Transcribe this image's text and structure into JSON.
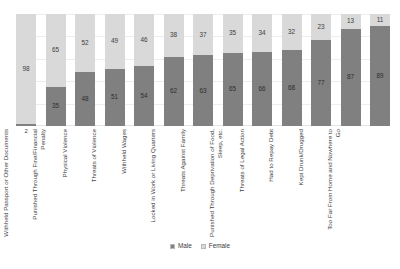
{
  "chart_data": {
    "type": "bar",
    "subtype": "stacked-100-percent",
    "orientation": "vertical",
    "title": "",
    "subtitle": "",
    "xlabel": "",
    "ylabel": "",
    "ylim": [
      0,
      100
    ],
    "grid": true,
    "grid_axis": "y",
    "y_ticks_visible": false,
    "legend_position": "bottom-center",
    "categories": [
      "Sexual Violence",
      "Withheld Passport or Other Documents",
      "Punished Through Fine/Financial Penalty",
      "Physical Violence",
      "Threats of Violence",
      "Withheld Wages",
      "Locked in Work or Living Quarters",
      "Threats Against Family",
      "Punished Through Deprivation of Food, Sleep, etc.",
      "Threats of Legal Action",
      "Had to Repay Debt",
      "Kept Drunk/Drugged",
      "Too Far From Home and Nowhere to Go"
    ],
    "series": [
      {
        "name": "Male",
        "color": "#808080",
        "values": [
          2,
          35,
          48,
          51,
          54,
          62,
          63,
          65,
          66,
          68,
          77,
          87,
          89
        ]
      },
      {
        "name": "Female",
        "color": "#d9d9d9",
        "values": [
          98,
          65,
          52,
          49,
          46,
          38,
          37,
          35,
          34,
          32,
          23,
          13,
          11
        ]
      }
    ],
    "data_labels": [
      {
        "category": "Sexual Violence",
        "male": 2,
        "female": 98
      },
      {
        "category": "Withheld Passport or Other Documents",
        "male": 35,
        "female": 65
      },
      {
        "category": "Punished Through Fine/Financial Penalty",
        "male": 48,
        "female": 52
      },
      {
        "category": "Physical Violence",
        "male": 51,
        "female": 49
      },
      {
        "category": "Threats of Violence",
        "male": 54,
        "female": 46
      },
      {
        "category": "Withheld Wages",
        "male": 62,
        "female": 38
      },
      {
        "category": "Locked in Work or Living Quarters",
        "male": 63,
        "female": 37
      },
      {
        "category": "Threats Against Family",
        "male": 65,
        "female": 35
      },
      {
        "category": "Punished Through Deprivation of Food, Sleep, etc.",
        "male": 66,
        "female": 34
      },
      {
        "category": "Threats of Legal Action",
        "male": 68,
        "female": 32
      },
      {
        "category": "Had to Repay Debt",
        "male": 77,
        "female": 23
      },
      {
        "category": "Kept Drunk/Drugged",
        "male": 87,
        "female": 13
      },
      {
        "category": "Too Far From Home and Nowhere to Go",
        "male": 89,
        "female": 11
      }
    ]
  },
  "legend": {
    "items": [
      {
        "label": "Male",
        "color": "#808080"
      },
      {
        "label": "Female",
        "color": "#d9d9d9"
      }
    ]
  },
  "colors": {
    "male": "#808080",
    "female": "#d9d9d9",
    "gridline": "#eceeee",
    "text": "#3d3d3d",
    "background": "#ffffff"
  }
}
